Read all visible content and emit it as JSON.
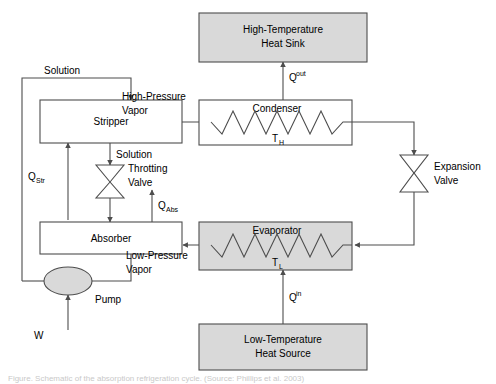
{
  "figure": {
    "stroke_color": "#4d4d4d",
    "shaded_fill": "#d9d9d9",
    "plain_fill": "#ffffff",
    "text_color": "#000000",
    "background": "#ffffff"
  },
  "components": {
    "heat_sink": {
      "line1": "High-Temperature",
      "line2": "Heat Sink",
      "shaded": true
    },
    "heat_source": {
      "line1": "Low-Temperature",
      "line2": "Heat Source",
      "shaded": true
    },
    "condenser": {
      "label": "Condenser",
      "temperature": "T",
      "temperature_sub": "H",
      "shaded": false
    },
    "evaporator": {
      "label": "Evaporator",
      "temperature": "T",
      "temperature_sub": "L",
      "shaded": true
    },
    "stripper": {
      "label": "Stripper",
      "shaded": false
    },
    "absorber": {
      "label": "Absorber",
      "shaded": false
    },
    "throttling_valve": {
      "line1": "Throtting",
      "line2": "Valve"
    },
    "expansion_valve": {
      "line1": "Expansion",
      "line2": "Valve"
    },
    "pump": {
      "label": "Pump"
    }
  },
  "stream_labels": {
    "solution_top": "Solution",
    "solution_mid": "Solution",
    "high_pressure_vapor_line1": "High-Pressure",
    "high_pressure_vapor_line2": "Vapor",
    "low_pressure_vapor_line1": "Low-Pressure",
    "low_pressure_vapor_line2": "Vapor"
  },
  "energy_labels": {
    "q_out": {
      "base": "Q",
      "script": "out",
      "kind": "superscript"
    },
    "q_in": {
      "base": "Q",
      "script": "in",
      "kind": "superscript"
    },
    "q_str": {
      "base": "Q",
      "script": "Str",
      "kind": "subscript"
    },
    "q_abs": {
      "base": "Q",
      "script": "Abs",
      "kind": "subscript"
    },
    "work": {
      "base": "W",
      "script": "",
      "kind": "none"
    }
  },
  "caption": {
    "text": "Figure. Schematic of the absorption refrigeration cycle.  (Source: Phillips et al. 2003)"
  }
}
